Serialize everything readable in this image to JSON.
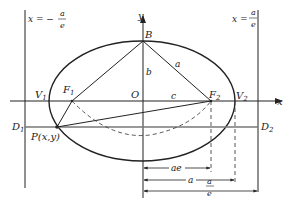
{
  "diagram": {
    "type": "ellipse-directrix-construction",
    "colors": {
      "ink": "#222222",
      "gray_line": "#777777"
    },
    "labels": {
      "directrix_left": "x = −",
      "directrix_left_num": "a",
      "directrix_left_den": "e",
      "directrix_right": "x =",
      "directrix_right_num": "a",
      "directrix_right_den": "e",
      "y_axis": "y",
      "x_axis": "x",
      "B": "B",
      "b": "b",
      "a_side": "a",
      "O": "O",
      "c": "c",
      "V1": "V",
      "V1_sub": "1",
      "V2": "V",
      "V2_sub": "2",
      "F1": "F",
      "F1_sub": "1",
      "F2": "F",
      "F2_sub": "2",
      "D1": "D",
      "D1_sub": "1",
      "D2": "D",
      "D2_sub": "2",
      "P": "P(x,y)",
      "dim_ae": "ae",
      "dim_a": "a",
      "dim_a_over_e_num": "a",
      "dim_a_over_e_den": "e"
    }
  }
}
